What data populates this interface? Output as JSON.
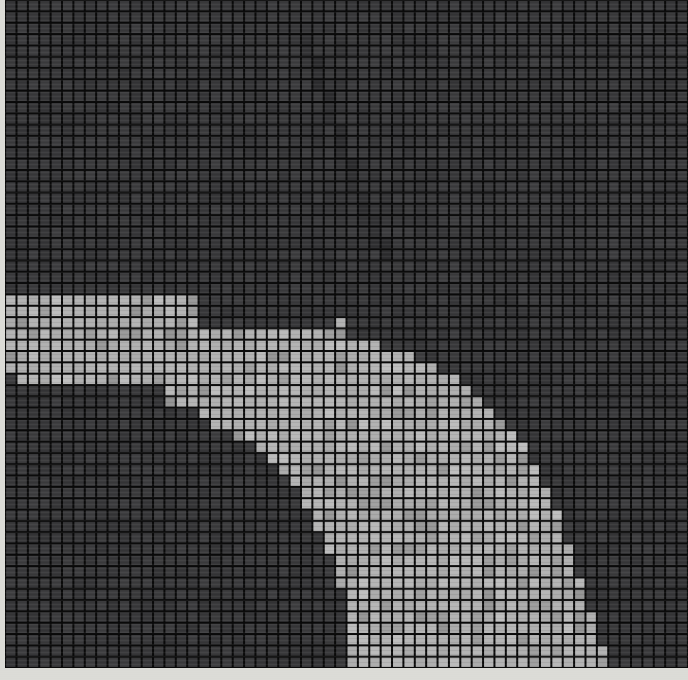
{
  "figure": {
    "title": "",
    "background_color": "#d4d4cf",
    "plot_background_color": "#0a0a0a"
  },
  "chart_data": {
    "type": "heatmap",
    "title": "",
    "subtitle": "",
    "xlabel": "",
    "ylabel": "",
    "legend": [],
    "annotations": [],
    "grid": true,
    "grid_color": "#0a0a0a",
    "grid_line_width": 1.6,
    "colorscale": "grayscale",
    "value_levels": {
      "background": 0.18,
      "faint": 0.22,
      "band_dim": 0.56,
      "band": 0.69,
      "band_bright": 0.72
    },
    "value_colors": {
      "background": "#3a3a3c",
      "faint": "#424244",
      "band_dim": "#9a9a9a",
      "band": "#b0b0b0",
      "band_bright": "#b8b8b8"
    },
    "ncols": 60,
    "nrows": 59,
    "cell_width_px": 11.38,
    "cell_height_px": 11.32,
    "xlim": [
      0,
      60
    ],
    "ylim": [
      0,
      59
    ],
    "band": {
      "name": "bright-arc",
      "description": "Broad bright staircase band entering at the left edge near row 26, arcing right and descending steeply to exit at the bottom edge near column 29",
      "row_spans": [
        {
          "row": 26,
          "start": 0,
          "end": 16
        },
        {
          "row": 27,
          "start": 0,
          "end": 16
        },
        {
          "row": 28,
          "start": 0,
          "end": 29
        },
        {
          "row": 29,
          "start": 0,
          "end": 31
        },
        {
          "row": 30,
          "start": 0,
          "end": 34
        },
        {
          "row": 31,
          "start": 0,
          "end": 36
        },
        {
          "row": 32,
          "start": 0,
          "end": 38
        },
        {
          "row": 33,
          "start": 1,
          "end": 39
        },
        {
          "row": 34,
          "start": 13,
          "end": 40
        },
        {
          "row": 35,
          "start": 13,
          "end": 41
        },
        {
          "row": 36,
          "start": 16,
          "end": 42
        },
        {
          "row": 37,
          "start": 17,
          "end": 43
        },
        {
          "row": 38,
          "start": 19,
          "end": 44
        },
        {
          "row": 39,
          "start": 21,
          "end": 45
        },
        {
          "row": 40,
          "start": 22,
          "end": 45
        },
        {
          "row": 41,
          "start": 23,
          "end": 46
        },
        {
          "row": 42,
          "start": 24,
          "end": 46
        },
        {
          "row": 43,
          "start": 25,
          "end": 47
        },
        {
          "row": 44,
          "start": 25,
          "end": 47
        },
        {
          "row": 45,
          "start": 26,
          "end": 48
        },
        {
          "row": 46,
          "start": 26,
          "end": 48
        },
        {
          "row": 47,
          "start": 27,
          "end": 48
        },
        {
          "row": 48,
          "start": 27,
          "end": 49
        },
        {
          "row": 49,
          "start": 28,
          "end": 49
        },
        {
          "row": 50,
          "start": 28,
          "end": 49
        },
        {
          "row": 51,
          "start": 28,
          "end": 50
        },
        {
          "row": 52,
          "start": 29,
          "end": 50
        },
        {
          "row": 53,
          "start": 29,
          "end": 50
        },
        {
          "row": 54,
          "start": 29,
          "end": 51
        },
        {
          "row": 55,
          "start": 29,
          "end": 51
        },
        {
          "row": 56,
          "start": 29,
          "end": 51
        },
        {
          "row": 57,
          "start": 29,
          "end": 52
        },
        {
          "row": 58,
          "start": 29,
          "end": 52
        }
      ],
      "inner_gap": {
        "description": "Dark wedge eroding the lower-left interior of the band as it descends",
        "row_spans": [
          {
            "row": 34,
            "start": 0,
            "end": 13
          },
          {
            "row": 35,
            "start": 0,
            "end": 13
          },
          {
            "row": 36,
            "start": 0,
            "end": 16
          },
          {
            "row": 37,
            "start": 0,
            "end": 17
          },
          {
            "row": 38,
            "start": 0,
            "end": 19
          },
          {
            "row": 39,
            "start": 0,
            "end": 21
          },
          {
            "row": 40,
            "start": 0,
            "end": 22
          },
          {
            "row": 41,
            "start": 0,
            "end": 23
          },
          {
            "row": 42,
            "start": 0,
            "end": 24
          },
          {
            "row": 43,
            "start": 0,
            "end": 25
          },
          {
            "row": 44,
            "start": 0,
            "end": 25
          },
          {
            "row": 45,
            "start": 0,
            "end": 26
          },
          {
            "row": 46,
            "start": 0,
            "end": 26
          },
          {
            "row": 47,
            "start": 0,
            "end": 27
          },
          {
            "row": 48,
            "start": 0,
            "end": 27
          },
          {
            "row": 49,
            "start": 0,
            "end": 28
          },
          {
            "row": 50,
            "start": 0,
            "end": 28
          },
          {
            "row": 51,
            "start": 0,
            "end": 28
          },
          {
            "row": 52,
            "start": 0,
            "end": 29
          },
          {
            "row": 53,
            "start": 0,
            "end": 29
          },
          {
            "row": 54,
            "start": 0,
            "end": 29
          },
          {
            "row": 55,
            "start": 0,
            "end": 29
          },
          {
            "row": 56,
            "start": 0,
            "end": 29
          },
          {
            "row": 57,
            "start": 0,
            "end": 29
          },
          {
            "row": 58,
            "start": 0,
            "end": 29
          }
        ]
      },
      "right_trim": {
        "description": "Dark cells trimming the upper-right edge of the band into a staircase",
        "cells": [
          {
            "row": 28,
            "cols": [
              17,
              18,
              19,
              20,
              21,
              22,
              23,
              24,
              25,
              26,
              27,
              28
            ]
          },
          {
            "row": 29,
            "cols": [
              30,
              31
            ]
          },
          {
            "row": 30,
            "cols": [
              33,
              34
            ]
          },
          {
            "row": 31,
            "cols": [
              36
            ]
          },
          {
            "row": 32,
            "cols": [
              38
            ]
          }
        ]
      }
    },
    "secondary_feature": {
      "name": "faint-dark-diagonal",
      "description": "Very faint darker diagonal streak crossing the upper-right quadrant from about (col 26, row 3) down to about (col 33, row 22)",
      "points": [
        {
          "col": 26,
          "row": 3
        },
        {
          "col": 27,
          "row": 6
        },
        {
          "col": 28,
          "row": 9
        },
        {
          "col": 29,
          "row": 12
        },
        {
          "col": 30,
          "row": 15
        },
        {
          "col": 31,
          "row": 18
        },
        {
          "col": 32,
          "row": 20
        },
        {
          "col": 33,
          "row": 22
        }
      ]
    }
  }
}
